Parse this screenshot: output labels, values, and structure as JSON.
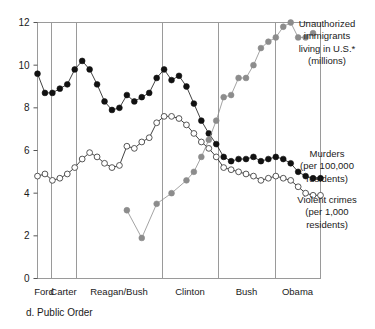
{
  "caption": "d. Public Order",
  "axis": {
    "y_ticks": [
      "0",
      "2",
      "4",
      "6",
      "8",
      "10",
      "12"
    ],
    "ylim": [
      0,
      12
    ],
    "y_tick_values": [
      0,
      2,
      4,
      6,
      8,
      10,
      12
    ]
  },
  "eras": [
    {
      "name": "Ford",
      "label": "Ford",
      "x_center": 44.0
    },
    {
      "name": "Carter",
      "label": "Carter",
      "x_center": 63.5
    },
    {
      "name": "Reagan/Bush",
      "label": "Reagan/Bush",
      "x_center": 119.0
    },
    {
      "name": "Clinton",
      "label": "Clinton",
      "x_center": 190.0
    },
    {
      "name": "Bush",
      "label": "Bush",
      "x_center": 246.5
    },
    {
      "name": "Obama",
      "label": "Obama",
      "x_center": 297.5
    }
  ],
  "era_boundaries": [
    51,
    76,
    162,
    218,
    275
  ],
  "legend": [
    {
      "key": "immigrants",
      "lines": [
        "Unauthorized",
        "immigrants",
        "living in U.S.*",
        "(millions)"
      ],
      "color": "#8c8c8c",
      "marker": "filled-gray",
      "x": 327,
      "y": 27
    },
    {
      "key": "murders",
      "lines": [
        "Murders",
        "(per 100,000",
        "residents)"
      ],
      "color": "#111111",
      "marker": "filled-black",
      "x": 327,
      "y": 157
    },
    {
      "key": "violent",
      "lines": [
        "Violent crimes",
        "(per 1,000",
        "residents)"
      ],
      "color": "#111111",
      "marker": "open",
      "x": 327,
      "y": 203
    }
  ],
  "chart_data": {
    "type": "line",
    "title": "d. Public Order",
    "xlabel": "",
    "ylabel": "",
    "ylim": [
      0,
      12
    ],
    "y_ticks": [
      0,
      2,
      4,
      6,
      8,
      10,
      12
    ],
    "grid": false,
    "legend_position": "right",
    "x_categories": [
      "Ford",
      "Carter",
      "Reagan/Bush",
      "Clinton",
      "Bush",
      "Obama"
    ],
    "annotations": [
      "* Unauthorized immigrants living in U.S. measured in millions"
    ],
    "series": [
      {
        "name": "Murders (per 100,000 residents)",
        "marker": "filled-black",
        "color": "#111111",
        "x": [
          1974,
          1975,
          1976,
          1977,
          1978,
          1979,
          1980,
          1981,
          1982,
          1983,
          1984,
          1985,
          1986,
          1987,
          1988,
          1989,
          1990,
          1991,
          1992,
          1993,
          1994,
          1995,
          1996,
          1997,
          1998,
          1999,
          2000,
          2001,
          2002,
          2003,
          2004,
          2005,
          2006,
          2007,
          2008,
          2009,
          2010,
          2011,
          2012
        ],
        "values": [
          9.6,
          8.7,
          8.7,
          8.9,
          9.1,
          9.8,
          10.2,
          9.8,
          9.1,
          8.3,
          7.9,
          8.0,
          8.6,
          8.3,
          8.5,
          8.7,
          9.4,
          9.8,
          9.3,
          9.5,
          9.0,
          8.2,
          7.4,
          6.8,
          6.3,
          5.7,
          5.5,
          5.6,
          5.6,
          5.7,
          5.5,
          5.6,
          5.7,
          5.6,
          5.4,
          5.0,
          4.8,
          4.7,
          4.7
        ]
      },
      {
        "name": "Violent crimes (per 1,000 residents)",
        "marker": "open",
        "color": "#111111",
        "x": [
          1974,
          1975,
          1976,
          1977,
          1978,
          1979,
          1980,
          1981,
          1982,
          1983,
          1984,
          1985,
          1986,
          1987,
          1988,
          1989,
          1990,
          1991,
          1992,
          1993,
          1994,
          1995,
          1996,
          1997,
          1998,
          1999,
          2000,
          2001,
          2002,
          2003,
          2004,
          2005,
          2006,
          2007,
          2008,
          2009,
          2010,
          2011,
          2012
        ],
        "values": [
          4.8,
          4.9,
          4.6,
          4.7,
          4.9,
          5.2,
          5.6,
          5.9,
          5.7,
          5.4,
          5.2,
          5.3,
          6.2,
          6.1,
          6.4,
          6.6,
          7.3,
          7.6,
          7.6,
          7.5,
          7.2,
          6.8,
          6.4,
          6.1,
          5.7,
          5.2,
          5.1,
          5.0,
          4.9,
          4.8,
          4.6,
          4.7,
          4.8,
          4.7,
          4.6,
          4.3,
          4.0,
          3.9,
          3.9
        ]
      },
      {
        "name": "Unauthorized immigrants living in U.S. (millions)",
        "marker": "filled-gray",
        "color": "#8c8c8c",
        "x": [
          1986,
          1988,
          1990,
          1992,
          1994,
          1995,
          1996,
          1997,
          1998,
          1999,
          2000,
          2001,
          2002,
          2003,
          2004,
          2005,
          2006,
          2007,
          2008,
          2009,
          2010,
          2011
        ],
        "values": [
          3.2,
          1.9,
          3.5,
          4.0,
          4.6,
          5.0,
          5.7,
          6.5,
          7.4,
          8.5,
          8.6,
          9.4,
          9.4,
          10.0,
          10.8,
          11.1,
          11.3,
          11.8,
          12.0,
          11.3,
          11.3,
          11.5
        ]
      }
    ]
  }
}
